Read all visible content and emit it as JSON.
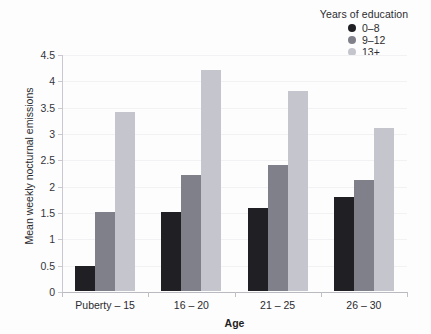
{
  "chart_data": {
    "type": "bar",
    "title": "",
    "xlabel": "Age",
    "ylabel": "Mean weekly nocturnal emissions",
    "categories": [
      "Puberty – 15",
      "16 – 20",
      "21 – 25",
      "26 – 30"
    ],
    "ylim": [
      0,
      4.5
    ],
    "yticks": [
      "0",
      "0.5",
      "1",
      "1.5",
      "2",
      "2.5",
      "3",
      "3.5",
      "4",
      "4.5"
    ],
    "ytick_values": [
      0,
      0.5,
      1,
      1.5,
      2,
      2.5,
      3,
      3.5,
      4,
      4.5
    ],
    "grid": true,
    "legend_position": "top-right",
    "legend_title": "Years of education",
    "series": [
      {
        "name": "0–8",
        "color": "#1f1f24",
        "values": [
          0.47,
          1.5,
          1.57,
          1.78
        ]
      },
      {
        "name": "9–12",
        "color": "#80808a",
        "values": [
          1.5,
          2.2,
          2.4,
          2.1
        ]
      },
      {
        "name": "13+",
        "color": "#c4c5cd",
        "values": [
          3.4,
          4.2,
          3.8,
          3.1
        ]
      }
    ]
  },
  "legend": {
    "title": "Years of education",
    "items": [
      {
        "label": "0–8",
        "color": "#1f1f24"
      },
      {
        "label": "9–12",
        "color": "#80808a"
      },
      {
        "label": "13+",
        "color": "#c4c5cd"
      }
    ]
  },
  "axes": {
    "y_title": "Mean weekly nocturnal emissions",
    "x_title": "Age"
  }
}
